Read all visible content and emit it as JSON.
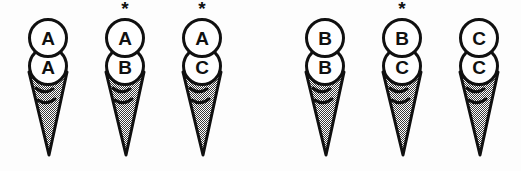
{
  "figure": {
    "background_color": "#fdfdfd",
    "ink_color": "#101010",
    "cone_fill_color": "#808080",
    "scoop_fill_color": "#ffffff",
    "asterisk_symbol": "*",
    "groups": [
      {
        "name": "group-a",
        "cones": [
          {
            "id": "cone-aa",
            "top_scoop": "A",
            "bottom_scoop": "A",
            "asterisk": "",
            "has_asterisk": false
          },
          {
            "id": "cone-ab",
            "top_scoop": "A",
            "bottom_scoop": "B",
            "asterisk": "*",
            "has_asterisk": true
          },
          {
            "id": "cone-ac",
            "top_scoop": "A",
            "bottom_scoop": "C",
            "asterisk": "*",
            "has_asterisk": true
          }
        ]
      },
      {
        "name": "group-b",
        "cones": [
          {
            "id": "cone-bb",
            "top_scoop": "B",
            "bottom_scoop": "B",
            "asterisk": "",
            "has_asterisk": false
          },
          {
            "id": "cone-bc",
            "top_scoop": "B",
            "bottom_scoop": "C",
            "asterisk": "*",
            "has_asterisk": true
          },
          {
            "id": "cone-cc",
            "top_scoop": "C",
            "bottom_scoop": "C",
            "asterisk": "",
            "has_asterisk": false
          }
        ]
      }
    ]
  }
}
